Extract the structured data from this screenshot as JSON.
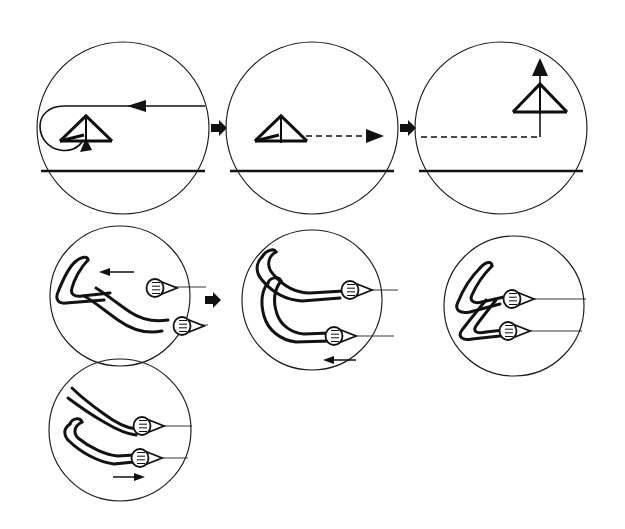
{
  "figure": {
    "background_color": "#ffffff",
    "ink_color": "#111111",
    "width": 625,
    "height": 529
  },
  "rows": [
    {
      "id": "flight-sequence",
      "label": "Flight path sequence",
      "panels": [
        {
          "id": "panel-approach-turn",
          "step": "1",
          "caption": "Glider turning through 180 degrees above the ground line",
          "circle": {
            "cx": 123,
            "cy": 128,
            "r": 86
          },
          "ground_line": {
            "y": 171,
            "x1": 41,
            "x2": 205
          },
          "flight_path": {
            "style": "solid",
            "description": "incoming track from right, U-turn at left",
            "arrow_direction": "left",
            "arrow_x": 137,
            "arrow_y": 106
          },
          "loop_arrow": {
            "direction": "up-right",
            "x": 83,
            "y": 148
          },
          "glider": {
            "orientation": "level-left",
            "cx": 86,
            "cy": 131,
            "span": 52
          }
        },
        {
          "id": "panel-level-run",
          "step": "2",
          "caption": "Glider flying level, dashed track running to the right",
          "circle": {
            "cx": 312,
            "cy": 128,
            "r": 86
          },
          "ground_line": {
            "y": 171,
            "x1": 230,
            "x2": 394
          },
          "flight_path": {
            "style": "dashed",
            "description": "dashed track to the right",
            "arrow_direction": "right",
            "arrow_x": 372,
            "arrow_y": 136
          },
          "glider": {
            "orientation": "level-left",
            "cx": 281,
            "cy": 131,
            "span": 52
          }
        },
        {
          "id": "panel-climb",
          "step": "3",
          "caption": "Glider nose-up climbing, dashed track arriving from the left",
          "circle": {
            "cx": 501,
            "cy": 128,
            "r": 86
          },
          "ground_line": {
            "y": 171,
            "x1": 419,
            "x2": 583
          },
          "flight_path": {
            "style": "dashed",
            "description": "dashed track from the left then vertical climb",
            "arrow_direction": "up",
            "arrow_x": 540,
            "arrow_y": 68
          },
          "glider": {
            "orientation": "nose-up",
            "cx": 540,
            "cy": 98,
            "span": 52
          }
        }
      ],
      "connectors": [
        {
          "id": "connector-1-2",
          "x": 218,
          "y": 128,
          "direction": "right"
        },
        {
          "id": "connector-2-3",
          "x": 407,
          "y": 128,
          "direction": "right"
        }
      ]
    },
    {
      "id": "hand-positions",
      "label": "Control bar hand positions",
      "panels": [
        {
          "id": "panel-grip-pull-in",
          "step": "1",
          "caption": "Arms crossed, upper hand pulled back on the bar",
          "circle": {
            "cx": 120,
            "cy": 296,
            "r": 70
          },
          "arms": "crossed-diagonal",
          "grips": [
            {
              "id": "grip-upper",
              "x": 163,
              "y": 286
            },
            {
              "id": "grip-lower",
              "x": 190,
              "y": 324
            }
          ],
          "bars": [
            {
              "id": "bar-upper",
              "y": 288,
              "x1": 175,
              "x2": 206
            },
            {
              "id": "bar-lower",
              "y": 326,
              "x1": 202,
              "x2": 206
            }
          ],
          "motion_arrow": {
            "direction": "left",
            "x": 118,
            "y": 272
          }
        },
        {
          "id": "panel-grip-neutral",
          "step": "2",
          "caption": "Arms stacked, both hands level on the bar",
          "circle": {
            "cx": 312,
            "cy": 300,
            "r": 70
          },
          "arms": "stacked-bent",
          "grips": [
            {
              "id": "grip-upper",
              "x": 357,
              "y": 289
            },
            {
              "id": "grip-lower",
              "x": 340,
              "y": 335
            }
          ],
          "bars": [
            {
              "id": "bar-upper",
              "y": 290,
              "x1": 369,
              "x2": 396
            },
            {
              "id": "bar-lower",
              "y": 336,
              "x1": 352,
              "x2": 392
            }
          ],
          "motion_arrow": {
            "direction": "left",
            "x": 340,
            "y": 360
          }
        },
        {
          "id": "panel-grip-tucked",
          "step": "3",
          "caption": "Arms tucked in close, hands held near the body",
          "circle": {
            "cx": 514,
            "cy": 306,
            "r": 70
          },
          "arms": "tucked-compact",
          "grips": [
            {
              "id": "grip-upper",
              "x": 519,
              "y": 298
            },
            {
              "id": "grip-lower",
              "x": 515,
              "y": 330
            }
          ],
          "bars": [
            {
              "id": "bar-upper",
              "y": 299,
              "x1": 531,
              "x2": 584
            },
            {
              "id": "bar-lower",
              "y": 331,
              "x1": 527,
              "x2": 580
            }
          ],
          "motion_arrow": null
        }
      ],
      "connectors": [
        {
          "id": "connector-grip-1-2",
          "x": 212,
          "y": 300,
          "direction": "right"
        }
      ]
    },
    {
      "id": "hand-positions-continued",
      "label": "Control bar hand positions continued",
      "panels": [
        {
          "id": "panel-grip-push-out",
          "step": "4",
          "caption": "Arms extended forward, bar pushed out",
          "circle": {
            "cx": 120,
            "cy": 430,
            "r": 71
          },
          "arms": "extended-forward",
          "grips": [
            {
              "id": "grip-upper",
              "x": 148,
              "y": 425
            },
            {
              "id": "grip-lower",
              "x": 147,
              "y": 457
            }
          ],
          "bars": [
            {
              "id": "bar-upper",
              "y": 426,
              "x1": 162,
              "x2": 190
            },
            {
              "id": "bar-lower",
              "y": 458,
              "x1": 160,
              "x2": 188
            }
          ],
          "motion_arrow": {
            "direction": "right",
            "x": 135,
            "y": 476
          }
        }
      ],
      "connectors": []
    }
  ]
}
